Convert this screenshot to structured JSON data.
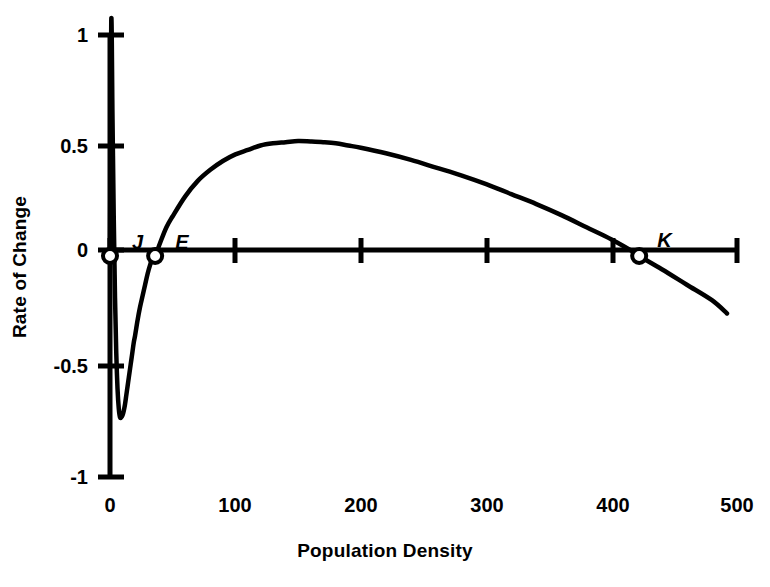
{
  "chart_data": {
    "type": "line",
    "title": "",
    "subtitle": "",
    "xlabel": "Population Density",
    "ylabel": "Rate of Change",
    "xlim": [
      0,
      500
    ],
    "ylim": [
      -1,
      1
    ],
    "grid": false,
    "legend": "none",
    "x_ticks": [
      {
        "value": 0,
        "label": "0"
      },
      {
        "value": 100,
        "label": "100"
      },
      {
        "value": 200,
        "label": "200"
      },
      {
        "value": 300,
        "label": "300"
      },
      {
        "value": 400,
        "label": "400"
      },
      {
        "value": 500,
        "label": "500"
      }
    ],
    "y_ticks": [
      {
        "value": 1,
        "label": "1"
      },
      {
        "value": 0.5,
        "label": "0.5"
      },
      {
        "value": 0,
        "label": "0"
      },
      {
        "value": -0.5,
        "label": "-0.5"
      },
      {
        "value": -1,
        "label": "-1"
      }
    ],
    "series": [
      {
        "name": "Rate of Change",
        "color": "#000000",
        "x": [
          0,
          1,
          2,
          3,
          4,
          5,
          6,
          7,
          8,
          9,
          10,
          11,
          12,
          13,
          14,
          15,
          16,
          17,
          18,
          19,
          20,
          22,
          24,
          26,
          28,
          30,
          32,
          34,
          36,
          40,
          45,
          50,
          60,
          70,
          80,
          90,
          100,
          110,
          120,
          130,
          140,
          150,
          160,
          170,
          180,
          190,
          200,
          220,
          240,
          260,
          280,
          300,
          320,
          340,
          360,
          380,
          400,
          420,
          422,
          440,
          460,
          480,
          492
        ],
        "y": [
          0,
          1.06,
          0.62,
          0.17,
          -0.19,
          -0.44,
          -0.6,
          -0.69,
          -0.73,
          -0.73,
          -0.72,
          -0.7,
          -0.67,
          -0.63,
          -0.59,
          -0.55,
          -0.51,
          -0.47,
          -0.43,
          -0.39,
          -0.36,
          -0.29,
          -0.23,
          -0.18,
          -0.13,
          -0.08,
          -0.04,
          -0.01,
          0.0,
          0.06,
          0.13,
          0.18,
          0.27,
          0.34,
          0.39,
          0.43,
          0.46,
          0.48,
          0.5,
          0.51,
          0.515,
          0.52,
          0.518,
          0.515,
          0.51,
          0.5,
          0.49,
          0.465,
          0.435,
          0.4,
          0.365,
          0.325,
          0.28,
          0.235,
          0.185,
          0.13,
          0.075,
          0.01,
          0.0,
          -0.06,
          -0.13,
          -0.2,
          -0.26
        ]
      }
    ],
    "annotations": [
      {
        "id": "J",
        "label": "J",
        "x": 0,
        "y": 0,
        "marker": "open-circle",
        "label_dx": 22,
        "label_dy": -24
      },
      {
        "id": "E",
        "label": "E",
        "x": 36,
        "y": 0,
        "marker": "open-circle",
        "label_dx": 20,
        "label_dy": -24
      },
      {
        "id": "K",
        "label": "K",
        "x": 422,
        "y": 0,
        "marker": "open-circle",
        "label_dx": 18,
        "label_dy": -26
      }
    ],
    "notes": {
      "peak": {
        "x": 150,
        "y": 0.52
      },
      "trough": {
        "x": 8.5,
        "y": -0.73
      },
      "equilibria": [
        "J",
        "E",
        "K"
      ]
    }
  },
  "colors": {
    "curve": "#000000",
    "axis": "#000000",
    "background": "#ffffff",
    "marker_fill": "#ffffff"
  }
}
